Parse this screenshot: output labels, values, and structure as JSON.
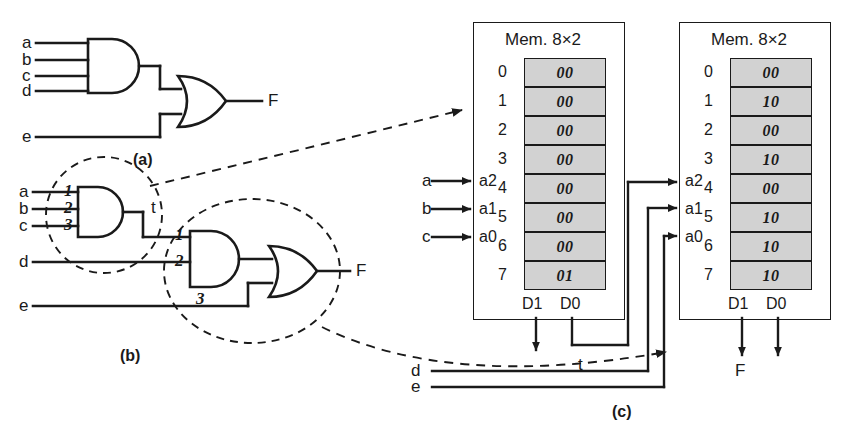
{
  "figure": {
    "caption_a": "(a)",
    "caption_b": "(b)",
    "caption_c": "(c)"
  },
  "panel_a": {
    "inputs": [
      "a",
      "b",
      "c",
      "d",
      "e"
    ],
    "gates": [
      {
        "name": "and-gate",
        "type": "AND",
        "inputs": [
          "a",
          "b",
          "c",
          "d"
        ]
      },
      {
        "name": "or-gate",
        "type": "OR",
        "inputs": [
          "and-out",
          "e"
        ]
      }
    ],
    "output": "F"
  },
  "panel_b": {
    "inputs": [
      "a",
      "b",
      "c",
      "d",
      "e"
    ],
    "intermediate": "t",
    "output": "F",
    "cut_labels_left": [
      "1",
      "2",
      "3"
    ],
    "cut_labels_right": [
      "1",
      "2",
      "3"
    ],
    "gates": [
      {
        "name": "and-gate-1",
        "type": "AND",
        "inputs": [
          "a",
          "b",
          "c"
        ],
        "output": "t"
      },
      {
        "name": "and-gate-2",
        "type": "AND",
        "inputs": [
          "t",
          "d"
        ]
      },
      {
        "name": "or-gate",
        "type": "OR",
        "inputs": [
          "and2-out",
          "e"
        ]
      }
    ]
  },
  "panel_c": {
    "memory1": {
      "title": "Mem. 8×2",
      "address_labels": [
        "a2",
        "a1",
        "a0"
      ],
      "address_sources": [
        "a",
        "b",
        "c"
      ],
      "data_labels": [
        "D1",
        "D0"
      ],
      "rows": [
        {
          "addr": "0",
          "word": "00"
        },
        {
          "addr": "1",
          "word": "00"
        },
        {
          "addr": "2",
          "word": "00"
        },
        {
          "addr": "3",
          "word": "00"
        },
        {
          "addr": "4",
          "word": "00"
        },
        {
          "addr": "5",
          "word": "00"
        },
        {
          "addr": "6",
          "word": "00"
        },
        {
          "addr": "7",
          "word": "01"
        }
      ],
      "output_signal": "t"
    },
    "memory2": {
      "title": "Mem. 8×2",
      "address_labels": [
        "a2",
        "a1",
        "a0"
      ],
      "address_sources": [
        "t",
        "d",
        "e"
      ],
      "data_labels": [
        "D1",
        "D0"
      ],
      "rows": [
        {
          "addr": "0",
          "word": "00"
        },
        {
          "addr": "1",
          "word": "10"
        },
        {
          "addr": "2",
          "word": "00"
        },
        {
          "addr": "3",
          "word": "10"
        },
        {
          "addr": "4",
          "word": "00"
        },
        {
          "addr": "5",
          "word": "10"
        },
        {
          "addr": "6",
          "word": "10"
        },
        {
          "addr": "7",
          "word": "10"
        }
      ],
      "output_signal": "F"
    },
    "external_inputs": [
      "d",
      "e"
    ],
    "intermediate": "t",
    "output": "F"
  },
  "colors": {
    "ink": "#1a1a1a",
    "cell_fill": "#d2d2d2",
    "paper": "#ffffff"
  }
}
